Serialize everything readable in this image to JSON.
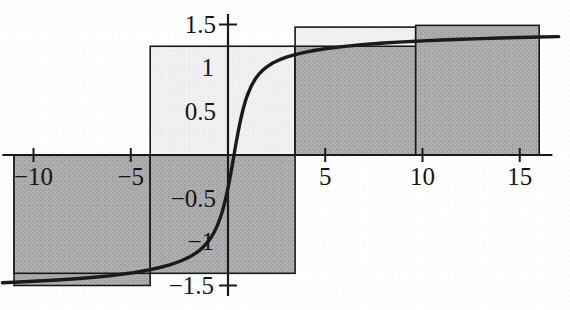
{
  "chart_data": {
    "type": "bar",
    "title": "",
    "subtitle": "",
    "xlabel": "",
    "ylabel": "",
    "xlim": [
      -11.6,
      17.5
    ],
    "ylim": [
      -1.72,
      1.72
    ],
    "grid": false,
    "legend": null,
    "x_ticks": [
      -10,
      -5,
      5,
      10,
      15
    ],
    "x_tick_labels": [
      "−10",
      "−5",
      "5",
      "10",
      "15"
    ],
    "y_ticks": [
      1.5,
      1,
      0.5,
      -0.5,
      -1,
      -1.5
    ],
    "y_tick_labels": [
      "1.5",
      "1",
      "0.5",
      "−0.5",
      "−1",
      "−1.5"
    ],
    "y_axis_cross_ticks": [
      1.5,
      -1.5
    ],
    "bars": [
      {
        "name": "bar-left-outer",
        "x0": -11.0,
        "x1": -4.0,
        "value": -1.5,
        "fill": "gray",
        "note": "lower step, outer"
      },
      {
        "name": "bar-left-inner",
        "x0": -11.0,
        "x1": -4.0,
        "value": -1.36,
        "fill": "gray",
        "note": "lower step, inner"
      },
      {
        "name": "bar-middle-light",
        "x0": -4.0,
        "x1": 3.45,
        "value": 1.25,
        "fill": "light",
        "note": "tall light step across origin"
      },
      {
        "name": "bar-middle-low",
        "x0": -4.0,
        "x1": 3.45,
        "value": -1.36,
        "fill": "gray",
        "note": "lower portion below axis"
      },
      {
        "name": "bar-right-light",
        "x0": 3.45,
        "x1": 9.65,
        "value": 1.47,
        "fill": "light",
        "note": "outer light cap"
      },
      {
        "name": "bar-right-dark",
        "x0": 3.45,
        "x1": 9.65,
        "value": 1.25,
        "fill": "gray",
        "note": "inner dark step"
      },
      {
        "name": "bar-far-right",
        "x0": 9.65,
        "x1": 16.0,
        "value": 1.49,
        "fill": "gray",
        "note": "final dark step"
      }
    ],
    "curve": {
      "name": "sigmoid-curve",
      "description": "smooth S-shaped (arctangent-like) curve",
      "asymptote_high": 1.5,
      "asymptote_low": -1.5,
      "inflection_x": 0,
      "points": [
        [
          -11.6,
          -1.468
        ],
        [
          -11.0,
          -1.462
        ],
        [
          -10.0,
          -1.452
        ],
        [
          -9.0,
          -1.44
        ],
        [
          -8.0,
          -1.426
        ],
        [
          -7.0,
          -1.408
        ],
        [
          -6.0,
          -1.386
        ],
        [
          -5.0,
          -1.357
        ],
        [
          -4.5,
          -1.339
        ],
        [
          -4.0,
          -1.318
        ],
        [
          -3.5,
          -1.293
        ],
        [
          -3.0,
          -1.263
        ],
        [
          -2.5,
          -1.224
        ],
        [
          -2.2,
          -1.196
        ],
        [
          -2.0,
          -1.174
        ],
        [
          -1.8,
          -1.149
        ],
        [
          -1.6,
          -1.119
        ],
        [
          -1.4,
          -1.084
        ],
        [
          -1.2,
          -1.041
        ],
        [
          -1.0,
          -0.988
        ],
        [
          -0.9,
          -0.957
        ],
        [
          -0.8,
          -0.922
        ],
        [
          -0.7,
          -0.882
        ],
        [
          -0.6,
          -0.836
        ],
        [
          -0.5,
          -0.783
        ],
        [
          -0.4,
          -0.723
        ],
        [
          -0.3,
          -0.654
        ],
        [
          -0.2,
          -0.574
        ],
        [
          -0.1,
          -0.483
        ],
        [
          0.0,
          -0.38
        ],
        [
          0.1,
          -0.265
        ],
        [
          0.2,
          -0.141
        ],
        [
          0.3,
          -0.012
        ],
        [
          0.4,
          0.117
        ],
        [
          0.5,
          0.24
        ],
        [
          0.6,
          0.354
        ],
        [
          0.7,
          0.456
        ],
        [
          0.8,
          0.546
        ],
        [
          0.9,
          0.623
        ],
        [
          1.0,
          0.69
        ],
        [
          1.2,
          0.795
        ],
        [
          1.4,
          0.873
        ],
        [
          1.6,
          0.932
        ],
        [
          1.8,
          0.977
        ],
        [
          2.0,
          1.013
        ],
        [
          2.3,
          1.057
        ],
        [
          2.6,
          1.09
        ],
        [
          3.0,
          1.124
        ],
        [
          3.45,
          1.154
        ],
        [
          4.0,
          1.183
        ],
        [
          4.5,
          1.204
        ],
        [
          5.0,
          1.221
        ],
        [
          6.0,
          1.249
        ],
        [
          7.0,
          1.27
        ],
        [
          8.0,
          1.287
        ],
        [
          9.0,
          1.3
        ],
        [
          9.65,
          1.308
        ],
        [
          10.0,
          1.312
        ],
        [
          11.0,
          1.322
        ],
        [
          12.0,
          1.331
        ],
        [
          13.0,
          1.338
        ],
        [
          14.0,
          1.345
        ],
        [
          15.0,
          1.351
        ],
        [
          16.0,
          1.356
        ],
        [
          17.0,
          1.361
        ]
      ]
    },
    "axis_color": "#1a1a1a",
    "curve_color": "#1a1a1a",
    "bar_edge_color": "#1a1a1a",
    "fill_gray": "#a9a9a9",
    "fill_light": "#f0f0f0",
    "background": "#ffffff"
  }
}
